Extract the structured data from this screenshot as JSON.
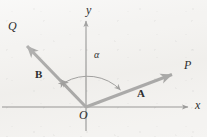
{
  "figure": {
    "background_color": "#f4f3f1",
    "axis_color": "#5a5a5a",
    "vector_color": "#7b7b7b",
    "arc_color": "#6e6e6e",
    "label_color": "#2e2e2e"
  },
  "axes": {
    "x_label": "x",
    "y_label": "y",
    "origin_label": "O",
    "origin": {
      "x": 86,
      "y": 107
    },
    "x_axis_end": {
      "x": 191,
      "y": 107
    },
    "y_axis_end": {
      "x": 86,
      "y": 18
    }
  },
  "vectors": [
    {
      "name": "A",
      "label": "A",
      "ray_label": "P",
      "tail": {
        "x": 86,
        "y": 107
      },
      "tip": {
        "x": 179,
        "y": 72
      },
      "label_position": {
        "x": 139,
        "y": 91
      },
      "ray_label_position": {
        "x": 185,
        "y": 62
      }
    },
    {
      "name": "B",
      "label": "B",
      "ray_label": "Q",
      "tail": {
        "x": 86,
        "y": 107
      },
      "tip": {
        "x": 18,
        "y": 37
      },
      "label_position": {
        "x": 38,
        "y": 74
      },
      "ray_label_position": {
        "x": 10,
        "y": 23
      },
      "midpoint_arrowhead": {
        "x": 59,
        "y": 78
      }
    }
  ],
  "angle": {
    "symbol": "α",
    "label_position": {
      "x": 94,
      "y": 53
    },
    "arc_radius": 46,
    "arc_from_vector": "B",
    "arc_to_vector": "A",
    "double_headed": true
  }
}
